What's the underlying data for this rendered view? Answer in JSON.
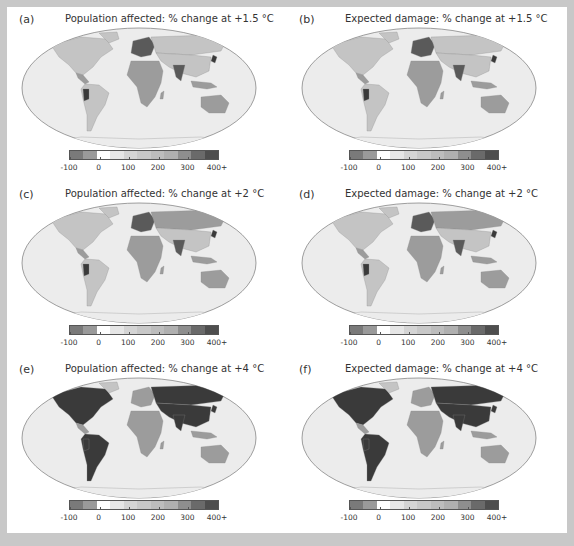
{
  "figure": {
    "panels": [
      {
        "id": "a",
        "letter": "(a)",
        "title": "Population affected: % change at +1.5 °C",
        "metric": "population_affected",
        "warming": "+1.5 °C",
        "shade": "light"
      },
      {
        "id": "b",
        "letter": "(b)",
        "title": "Expected damage: % change at +1.5 °C",
        "metric": "expected_damage",
        "warming": "+1.5 °C",
        "shade": "light"
      },
      {
        "id": "c",
        "letter": "(c)",
        "title": "Population affected: % change at +2 °C",
        "metric": "population_affected",
        "warming": "+2 °C",
        "shade": "medium"
      },
      {
        "id": "d",
        "letter": "(d)",
        "title": "Expected damage: % change at +2 °C",
        "metric": "expected_damage",
        "warming": "+2 °C",
        "shade": "medium"
      },
      {
        "id": "e",
        "letter": "(e)",
        "title": "Population affected: % change at +4 °C",
        "metric": "population_affected",
        "warming": "+4 °C",
        "shade": "dark"
      },
      {
        "id": "f",
        "letter": "(f)",
        "title": "Expected damage: % change at +4 °C",
        "metric": "expected_damage",
        "warming": "+4 °C",
        "shade": "dark"
      }
    ],
    "colorbar": {
      "ticks": [
        "-100",
        "0",
        "100",
        "200",
        "300",
        "400+"
      ],
      "colors": [
        "#7a7a7a",
        "#9a9a9a",
        "#ffffff",
        "#e6e6e6",
        "#d4d4d4",
        "#c8c8c8",
        "#bdbdbd",
        "#b0b0b0",
        "#8e8e8e",
        "#6a6a6a",
        "#4e4e4e"
      ]
    },
    "colors": {
      "frame": "#c8c8c8",
      "background": "#ffffff",
      "ocean": "#ececec",
      "land_light": "#c4c4c4",
      "land_mid": "#9c9c9c",
      "land_dark": "#5a5a5a",
      "land_darkest": "#3a3a3a"
    }
  }
}
